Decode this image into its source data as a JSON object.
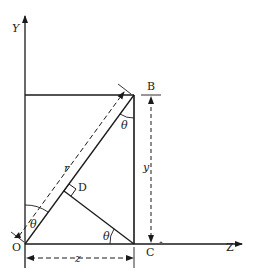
{
  "diagram": {
    "axes": {
      "y_label": "Y",
      "z_label": "Z"
    },
    "points": {
      "origin": "O",
      "B": "B",
      "C": "C",
      "D": "D"
    },
    "dimensions": {
      "horizontal": "z",
      "vertical": "y",
      "diagonal": "r"
    },
    "angle": "θ",
    "colors": {
      "line": "#1a1a1a",
      "background": "#ffffff"
    }
  }
}
